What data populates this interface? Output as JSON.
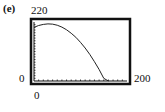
{
  "chart_data": {
    "type": "line",
    "title": "",
    "part_label": "(e)",
    "xlabel": "",
    "ylabel": "",
    "xlim": [
      0,
      200
    ],
    "ylim": [
      0,
      220
    ],
    "xscl": 10,
    "yscl": 10,
    "grid": false,
    "window_labels": {
      "xmin": "0",
      "xmax": "200",
      "ymin": "0",
      "ymax": "220"
    },
    "series": [
      {
        "name": "projectile path",
        "x": [
          0,
          10,
          20,
          30,
          40,
          50,
          60,
          70,
          80,
          90,
          100,
          110,
          120,
          130,
          140,
          150,
          160
        ],
        "y": [
          200,
          207,
          211,
          213,
          212,
          208,
          201,
          191,
          178,
          163,
          144,
          123,
          99,
          72,
          43,
          10,
          0
        ]
      }
    ],
    "style": {
      "frame_color": "#111111",
      "curve_color": "#222222"
    }
  }
}
